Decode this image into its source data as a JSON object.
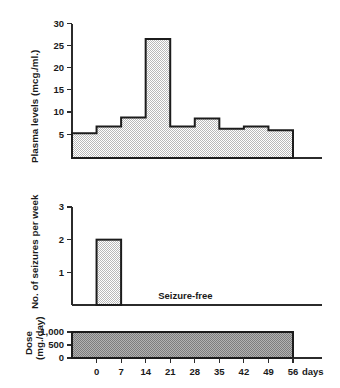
{
  "chart_data": [
    {
      "id": "plasma-levels",
      "type": "area",
      "title": "",
      "ylabel": "Plasma levels (mcg./ml.)",
      "xlabel": "",
      "ylim": [
        0,
        30
      ],
      "yticks": [
        5,
        10,
        15,
        20,
        25,
        30
      ],
      "ytick_labels": [
        "5",
        "10",
        "15",
        "20",
        "25",
        "30"
      ],
      "xlim": [
        -7,
        56
      ],
      "grid": false,
      "step_style": "post",
      "x_edges": [
        -7,
        0,
        7,
        14,
        21,
        28,
        35,
        42,
        49,
        56
      ],
      "values": [
        5.5,
        7.0,
        9.0,
        26.5,
        7.0,
        8.8,
        6.5,
        7.0,
        6.2
      ],
      "units": "mcg./ml."
    },
    {
      "id": "seizures-per-week",
      "type": "bar",
      "title": "",
      "ylabel": "No. of seizures per week",
      "xlabel": "",
      "ylim": [
        0,
        3
      ],
      "yticks": [
        1,
        2,
        3
      ],
      "ytick_labels": [
        "1",
        "2",
        "3"
      ],
      "xlim": [
        -7,
        56
      ],
      "grid": false,
      "categories": [
        "0-7"
      ],
      "bar_x_start": [
        0
      ],
      "bar_x_end": [
        7
      ],
      "values": [
        2
      ],
      "annotations": [
        {
          "text": "Seizure-free",
          "x": 21,
          "y": 0.18
        }
      ]
    },
    {
      "id": "dose-per-day",
      "type": "bar",
      "title": "",
      "ylabel_lines": [
        "Dose",
        "(mg./day)"
      ],
      "xlabel": "days",
      "ylim": [
        0,
        1000
      ],
      "yticks": [
        0,
        500,
        1000
      ],
      "ytick_labels": [
        "0",
        "500",
        "1,000"
      ],
      "xlim": [
        -7,
        56
      ],
      "xticks": [
        0,
        7,
        14,
        21,
        28,
        35,
        42,
        49,
        56
      ],
      "xtick_labels": [
        "0",
        "7",
        "14",
        "21",
        "28",
        "35",
        "42",
        "49",
        "56"
      ],
      "x_unit_label": "days",
      "grid": false,
      "bar_x_start": [
        -7
      ],
      "bar_x_end": [
        56
      ],
      "values": [
        1000
      ]
    }
  ],
  "colors": {
    "outline": "#1c1c1c",
    "axis": "#2b2b2b",
    "fill_light": "#d8d8d8",
    "fill_dark": "#9a9a9a",
    "background": "#ffffff",
    "text": "#1a1a1a"
  },
  "panels": {
    "top": {
      "ylabel": "Plasma levels (mcg./ml.)"
    },
    "middle": {
      "ylabel": "No. of seizures per week",
      "note": "Seizure-free"
    },
    "bottom": {
      "ylabel_line1": "Dose",
      "ylabel_line2": "(mg./day)",
      "xunit": "days"
    }
  },
  "ytick_top": [
    "5",
    "10",
    "15",
    "20",
    "25",
    "30"
  ],
  "ytick_mid": [
    "1",
    "2",
    "3"
  ],
  "ytick_bot": [
    "0",
    "500",
    "1,000"
  ],
  "xtick_bot": [
    "0",
    "7",
    "14",
    "21",
    "28",
    "35",
    "42",
    "49",
    "56"
  ],
  "xunit_bot": "days"
}
